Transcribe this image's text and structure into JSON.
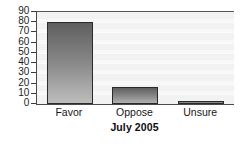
{
  "chart_data": {
    "type": "bar",
    "title": "July 2005",
    "xlabel": "",
    "ylabel": "",
    "categories": [
      "Favor",
      "Oppose",
      "Unsure"
    ],
    "values": [
      80,
      17,
      2
    ],
    "ylim": [
      0,
      90
    ],
    "yticks": [
      0,
      10,
      20,
      30,
      40,
      50,
      60,
      70,
      80,
      90
    ],
    "ytick_labels": [
      "0",
      "10",
      "20",
      "30",
      "40",
      "50",
      "60",
      "70",
      "80",
      "90"
    ],
    "grid": true,
    "grid_orientation": "horizontal",
    "legend": false,
    "legend_position": "none",
    "bar_fill_top": "#5f5f5f",
    "bar_fill_bottom": "#bdbdbd",
    "bar_border_color": "#2a2a2a",
    "plot_background": "#f2f2f2",
    "axis_color": "#4a4a4a",
    "text_color": "#161616"
  }
}
